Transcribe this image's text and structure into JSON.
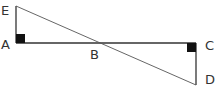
{
  "diagram": {
    "type": "geometry",
    "points": {
      "E": {
        "label": "E",
        "x": 16,
        "y": 6
      },
      "A": {
        "label": "A",
        "x": 16,
        "y": 43
      },
      "B": {
        "label": "B",
        "x": 98,
        "y": 43
      },
      "C": {
        "label": "C",
        "x": 196,
        "y": 43
      },
      "D": {
        "label": "D",
        "x": 196,
        "y": 85
      }
    },
    "segments": [
      "EA",
      "AC",
      "CD",
      "ED"
    ],
    "right_angles": [
      "A",
      "C"
    ],
    "colors": {
      "line": "#333333",
      "marker": "#111111",
      "label": "#333333"
    }
  }
}
